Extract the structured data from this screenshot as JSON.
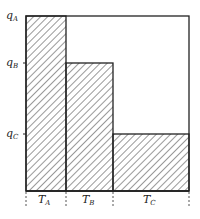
{
  "diagram": {
    "type": "staircase-bar-diagram",
    "y_labels": [
      {
        "id": "qA",
        "base": "q",
        "sub": "A"
      },
      {
        "id": "qB",
        "base": "q",
        "sub": "B"
      },
      {
        "id": "qC",
        "base": "q",
        "sub": "C"
      }
    ],
    "x_labels": [
      {
        "id": "TA",
        "base": "T",
        "sub": "A"
      },
      {
        "id": "TB",
        "base": "T",
        "sub": "B"
      },
      {
        "id": "TC",
        "base": "T",
        "sub": "C"
      }
    ],
    "bars": [
      {
        "name": "A",
        "duration_label": "TA",
        "level_label": "qA",
        "relative_width": 0.25,
        "relative_height": 1.0
      },
      {
        "name": "B",
        "duration_label": "TB",
        "level_label": "qB",
        "relative_width": 0.29,
        "relative_height": 0.73
      },
      {
        "name": "C",
        "duration_label": "TC",
        "level_label": "qC",
        "relative_width": 0.46,
        "relative_height": 0.33
      }
    ],
    "fill_pattern": "diagonal-hatch",
    "colors": {
      "line": "#222222",
      "hatch": "#333333",
      "background": "#ffffff"
    }
  }
}
